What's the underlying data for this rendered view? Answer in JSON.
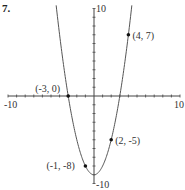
{
  "problem": {
    "number": "7."
  },
  "chart_data": {
    "type": "line",
    "title": "",
    "function": "y = x^2 - 9",
    "xlabel": "",
    "ylabel": "",
    "xlim": [
      -10,
      10
    ],
    "ylim": [
      -10,
      10
    ],
    "grid": false,
    "axis_labels": {
      "x_min": "-10",
      "x_max": "10",
      "y_min": "-10",
      "y_max": "10"
    },
    "points": [
      {
        "x": -3,
        "y": 0,
        "label": "(-3, 0)"
      },
      {
        "x": -1,
        "y": -8,
        "label": "(-1, -8)"
      },
      {
        "x": 2,
        "y": -5,
        "label": "(2, -5)"
      },
      {
        "x": 4,
        "y": 7,
        "label": "(4, 7)"
      }
    ]
  }
}
